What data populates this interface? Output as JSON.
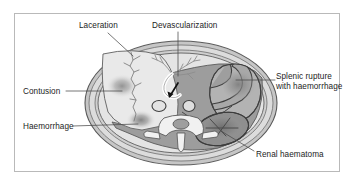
{
  "figure": {
    "type": "medical-illustration",
    "labels": {
      "laceration": "Laceration",
      "devascularization": "Devascularization",
      "splenic_line1": "Splenic rupture",
      "splenic_line2": "with haemorrhage",
      "contusion": "Contusion",
      "haemorrhage": "Haemorrhage",
      "renal_haematoma": "Renal haematoma"
    },
    "structures": {
      "body_wall": "body-wall",
      "liver": "liver",
      "spleen": "spleen",
      "kidney": "kidney",
      "vertebra": "vertebra",
      "aorta": "aorta",
      "inferior_vena_cava": "inferior-vena-cava",
      "vascular_tree": "vascular-tree",
      "arrow": "devascularization-arrow"
    },
    "colors": {
      "frame": "#b9b9b9",
      "background": "#ffffff",
      "skin_band": "#c9c9c9",
      "body_wall_fill": "#d8d8d8",
      "liver_fill": "#e8e8e8",
      "retroperitoneum_fill": "#9a9a9a",
      "spleen_fill": "#b0b0b0",
      "kidney_fill": "#8d8d8d",
      "bone_fill": "#efefef",
      "vessel_fill": "#ffffff",
      "lesion_dark": "#8a8a8a",
      "outline": "#4a4a4a",
      "text": "#1d1d1d"
    }
  }
}
